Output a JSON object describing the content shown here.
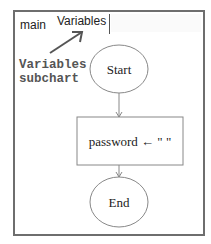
{
  "tabs": [
    {
      "label": "main",
      "active": false
    },
    {
      "label": "Variables",
      "active": true
    }
  ],
  "annotation": {
    "line1": "Variables",
    "line2": "subchart"
  },
  "flowchart": {
    "start": "Start",
    "assignment": "password ← \" \"",
    "end": "End"
  },
  "colors": {
    "frame_border": "#6e6e6e",
    "shape_stroke": "#888888",
    "annotation_text": "#555555"
  }
}
